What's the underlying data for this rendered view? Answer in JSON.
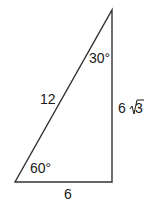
{
  "diagram": {
    "type": "right-triangle",
    "labels": {
      "hypotenuse": "12",
      "short_leg": "6",
      "long_leg_coef": "6",
      "long_leg_radical": "3",
      "angle_top": "30°",
      "angle_bottom_left": "60°"
    },
    "colors": {
      "line": "#333333",
      "text": "#1a1a1a"
    }
  }
}
